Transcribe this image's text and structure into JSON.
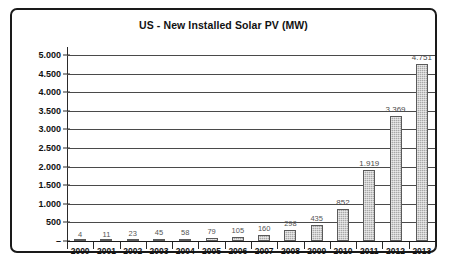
{
  "chart_data": {
    "type": "bar",
    "title": "US - New Installed Solar PV (MW)",
    "xlabel": "",
    "ylabel": "",
    "categories": [
      "2000",
      "2001",
      "2002",
      "2003",
      "2004",
      "2005",
      "2006",
      "2007",
      "2008",
      "2009",
      "2010",
      "2011",
      "2012",
      "2013"
    ],
    "values": [
      4,
      11,
      23,
      45,
      58,
      79,
      105,
      160,
      298,
      435,
      852,
      1919,
      3369,
      4751
    ],
    "value_labels": [
      "4",
      "11",
      "23",
      "45",
      "58",
      "79",
      "105",
      "160",
      "298",
      "435",
      "852",
      "1.919",
      "3.369",
      "4.751"
    ],
    "ylim": [
      0,
      5000
    ],
    "yticks": [
      0,
      500,
      1000,
      1500,
      2000,
      2500,
      3000,
      3500,
      4000,
      4500,
      5000
    ],
    "ytick_labels": [
      "–",
      "500",
      "1.000",
      "1.500",
      "2.000",
      "2.500",
      "3.000",
      "3.500",
      "4.000",
      "4.500",
      "5.000"
    ],
    "grid": true,
    "legend": false,
    "bar_color": "#a8a8a8",
    "bar_border_color": "#5a5a5a",
    "gridline_color": "#4a4a4a",
    "axis_color": "#1a1a1a",
    "frame_color": "#1a1a1a",
    "background": "#ffffff"
  }
}
